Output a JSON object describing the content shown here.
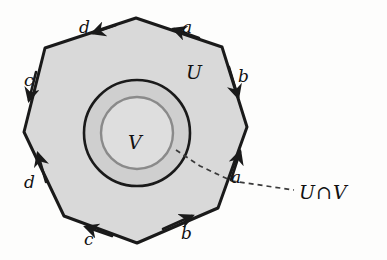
{
  "figure": {
    "kind": "topology-diagram",
    "background_color": "#fdfdfc"
  },
  "polygon": {
    "name": "octagon-U",
    "fill_color": "#d9d9d9",
    "stroke_color": "#1a1a1a",
    "vertices": [
      [
        136,
        18
      ],
      [
        222,
        47
      ],
      [
        247,
        127
      ],
      [
        218,
        208
      ],
      [
        137,
        243
      ],
      [
        64,
        216
      ],
      [
        24,
        132
      ],
      [
        45,
        48
      ]
    ]
  },
  "circles": {
    "outer": {
      "name": "outer-circle",
      "cx": 137,
      "cy": 133,
      "r": 53,
      "stroke_color": "#1a1a1a",
      "fill_color": "#cfcfcf"
    },
    "inner": {
      "name": "inner-circle",
      "cx": 137,
      "cy": 133,
      "r": 36,
      "stroke_color": "#8a8a8a",
      "fill_color": "#dedede"
    }
  },
  "edge_labels": [
    {
      "id": "a-top",
      "text": "a",
      "x": 182,
      "y": 19
    },
    {
      "id": "b-right",
      "text": "b",
      "x": 238,
      "y": 68
    },
    {
      "id": "a-lower",
      "text": "a",
      "x": 231,
      "y": 169
    },
    {
      "id": "b-bottom",
      "text": "b",
      "x": 181,
      "y": 225
    },
    {
      "id": "c-bottom",
      "text": "c",
      "x": 84,
      "y": 231
    },
    {
      "id": "d-lower",
      "text": "d",
      "x": 24,
      "y": 174
    },
    {
      "id": "c-left",
      "text": "c",
      "x": 24,
      "y": 72
    },
    {
      "id": "d-top",
      "text": "d",
      "x": 79,
      "y": 19
    }
  ],
  "region_labels": [
    {
      "id": "label-U",
      "text": "U",
      "x": 186,
      "y": 63
    },
    {
      "id": "label-V",
      "text": "V",
      "x": 128,
      "y": 133
    }
  ],
  "callout": {
    "name": "intersection-callout",
    "left_text": "U",
    "operator": "∩",
    "right_text": "V",
    "x": 299,
    "y": 183,
    "leader_color": "#3a3a3a",
    "leader_path": "M 176 150 L 200 166 L 232 181 L 294 190",
    "dash_pattern": "5 4"
  },
  "colors": {
    "ink": "#1a1a1a",
    "annulus_fill": "#cfcfcf",
    "disk_fill": "#dedede",
    "polygon_fill": "#d9d9d9",
    "inner_circle_stroke": "#8a8a8a"
  }
}
